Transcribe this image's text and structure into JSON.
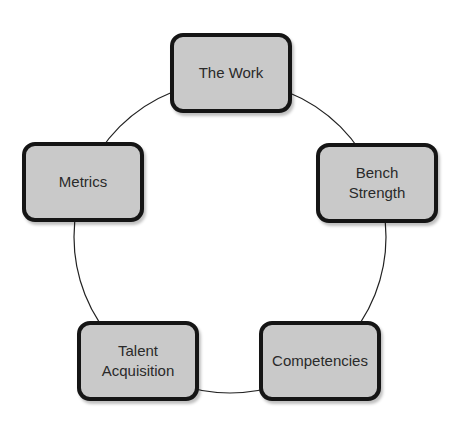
{
  "diagram": {
    "type": "cycle",
    "ring": {
      "cx": 230,
      "cy": 237,
      "r": 156,
      "stroke": "#222222"
    },
    "node_style": {
      "fill": "#c9c9c9",
      "border": "#151515"
    },
    "nodes": [
      {
        "id": "the-work",
        "label": "The Work",
        "x": 170,
        "y": 33
      },
      {
        "id": "bench-strength",
        "label": "Bench\nStrength",
        "x": 316,
        "y": 143
      },
      {
        "id": "competencies",
        "label": "Competencies",
        "x": 259,
        "y": 321
      },
      {
        "id": "talent-acquisition",
        "label": "Talent\nAcquisition",
        "x": 77,
        "y": 321
      },
      {
        "id": "metrics",
        "label": "Metrics",
        "x": 22,
        "y": 142
      }
    ]
  }
}
